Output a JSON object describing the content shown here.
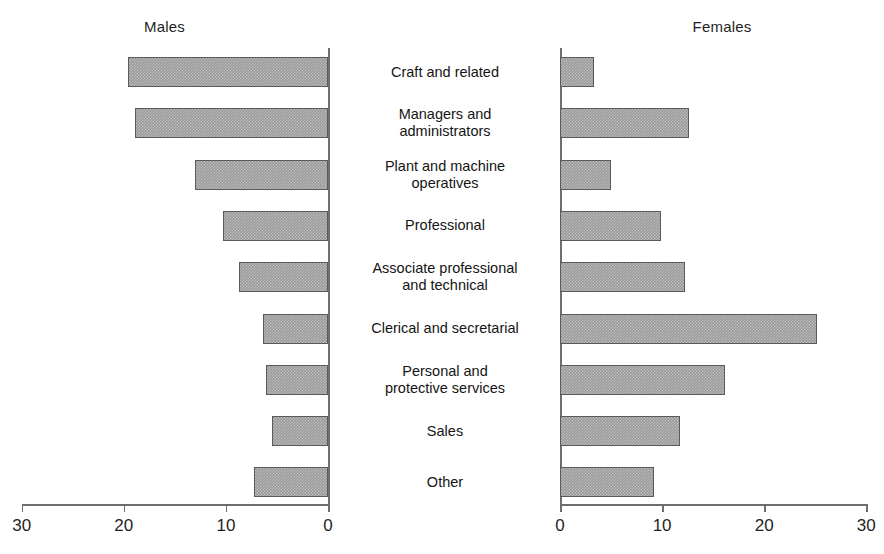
{
  "figure": {
    "left_panel_title": "Males",
    "right_panel_title": "Females"
  },
  "axes": {
    "left_ticks": [
      "30",
      "20",
      "10",
      "0"
    ],
    "right_ticks": [
      "0",
      "10",
      "20",
      "30"
    ]
  },
  "categories": [
    "Craft and related",
    "Managers and\nadministrators",
    "Plant and machine\noperatives",
    "Professional",
    "Associate professional\nand technical",
    "Clerical and secretarial",
    "Personal and\nprotective services",
    "Sales",
    "Other"
  ],
  "chart_data": {
    "type": "bar",
    "title": "",
    "orientation": "horizontal",
    "layout": "back-to-back population pyramid",
    "categories": [
      "Craft and related",
      "Managers and administrators",
      "Plant and machine operatives",
      "Professional",
      "Associate professional and technical",
      "Clerical and secretarial",
      "Personal and protective services",
      "Sales",
      "Other"
    ],
    "series": [
      {
        "name": "Males",
        "side": "left",
        "values": [
          19.6,
          18.9,
          13.0,
          10.3,
          8.7,
          6.4,
          6.1,
          5.5,
          7.2
        ]
      },
      {
        "name": "Females",
        "side": "right",
        "values": [
          3.3,
          12.6,
          5.0,
          9.9,
          12.2,
          25.2,
          16.2,
          11.8,
          9.2
        ]
      }
    ],
    "xlabel": "",
    "ylabel": "",
    "xlim_left": [
      30,
      0
    ],
    "xlim_right": [
      0,
      30
    ],
    "left_tick_values": [
      30,
      20,
      10,
      0
    ],
    "right_tick_values": [
      0,
      10,
      20,
      30
    ],
    "grid": false,
    "legend": "none",
    "bar_fill": "#9a9a9a",
    "bar_edge": "#5a5a5a",
    "axis_color": "#6e6e6e"
  }
}
